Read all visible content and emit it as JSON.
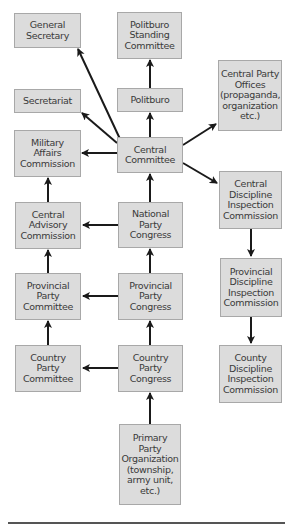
{
  "diagram": {
    "title": "",
    "nodes": {
      "general_secretary": {
        "label": "General\nSecretary"
      },
      "politburo_standing_committee": {
        "label": "Politburo\nStanding\nCommittee"
      },
      "central_party_offices": {
        "label": "Central Party\nOffices\n(propaganda,\norganization\netc.)"
      },
      "secretariat": {
        "label": "Secretariat"
      },
      "politburo": {
        "label": "Politburo"
      },
      "military_affairs_commission": {
        "label": "Military\nAffairs\nCommission"
      },
      "central_committee": {
        "label": "Central\nCommittee"
      },
      "central_discipline_inspection_commission": {
        "label": "Central\nDiscipline\nInspection\nCommission"
      },
      "central_advisory_commission": {
        "label": "Central\nAdvisory\nCommission"
      },
      "national_party_congress": {
        "label": "National\nParty\nCongress"
      },
      "provincial_discipline_inspection_commission": {
        "label": "Provincial\nDiscipline\nInspection\nCommission"
      },
      "provincial_party_committee": {
        "label": "Provincial\nParty\nCommittee"
      },
      "provincial_party_congress": {
        "label": "Provincial\nParty\nCongress"
      },
      "country_party_committee": {
        "label": "Country\nParty\nCommittee"
      },
      "country_party_congress": {
        "label": "Country\nParty\nCongress"
      },
      "county_discipline_inspection_commission": {
        "label": "County\nDiscipline\nInspection\nCommission"
      },
      "primary_party_organization": {
        "label": "Primary\nParty\nOrganization\n(township,\narmy unit,\netc.)"
      }
    },
    "edges": [
      {
        "from": "central_committee",
        "to": "general_secretary"
      },
      {
        "from": "central_committee",
        "to": "secretariat"
      },
      {
        "from": "central_committee",
        "to": "politburo"
      },
      {
        "from": "politburo",
        "to": "politburo_standing_committee"
      },
      {
        "from": "central_committee",
        "to": "military_affairs_commission"
      },
      {
        "from": "central_committee",
        "to": "central_party_offices"
      },
      {
        "from": "central_committee",
        "to": "central_discipline_inspection_commission"
      },
      {
        "from": "national_party_congress",
        "to": "central_committee"
      },
      {
        "from": "national_party_congress",
        "to": "central_advisory_commission"
      },
      {
        "from": "central_advisory_commission",
        "to": "military_affairs_commission"
      },
      {
        "from": "provincial_party_congress",
        "to": "national_party_congress"
      },
      {
        "from": "provincial_party_congress",
        "to": "provincial_party_committee"
      },
      {
        "from": "provincial_party_committee",
        "to": "central_advisory_commission"
      },
      {
        "from": "country_party_congress",
        "to": "provincial_party_congress"
      },
      {
        "from": "country_party_congress",
        "to": "country_party_committee"
      },
      {
        "from": "country_party_committee",
        "to": "provincial_party_committee"
      },
      {
        "from": "primary_party_organization",
        "to": "country_party_congress"
      },
      {
        "from": "central_discipline_inspection_commission",
        "to": "provincial_discipline_inspection_commission"
      },
      {
        "from": "provincial_discipline_inspection_commission",
        "to": "county_discipline_inspection_commission"
      }
    ],
    "colors": {
      "box_fill": "#dcdcdc",
      "box_border": "#a8a8a8",
      "arrow": "#1a1a1a",
      "text": "#3a3a3a"
    }
  }
}
